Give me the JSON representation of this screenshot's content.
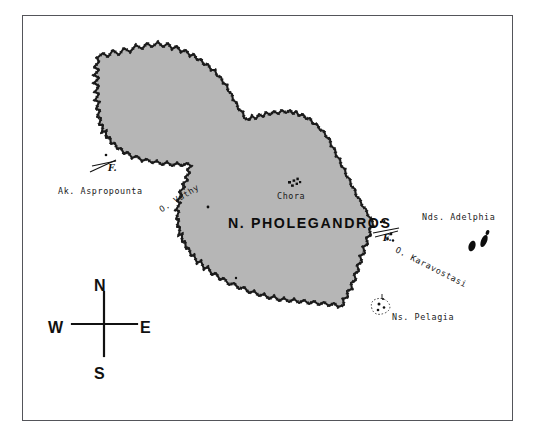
{
  "map": {
    "title": "N. PHOLEGANDROS",
    "style": {
      "land_fill": "#b6b6b6",
      "coast_stroke": "#1b1b1b",
      "frame_stroke": "#54555a",
      "sea_fill": "#ffffff",
      "text_color": "#1a1a1a"
    },
    "island_label": "N. PHOLEGANDROS",
    "settlements": [
      {
        "name": "Chora",
        "marker": "settlement-dots"
      }
    ],
    "capes": [
      {
        "name": "Ak. Aspropounta",
        "marker": "lighthouse",
        "marker_label": "F."
      }
    ],
    "bays": [
      {
        "name": "O. Vathy"
      },
      {
        "name": "O. Karavostasi",
        "marker": "lighthouse",
        "marker_label": "F."
      }
    ],
    "islets": [
      {
        "name": "Nds. Adelphia"
      },
      {
        "name": "Ns. Pelagia"
      }
    ],
    "lighthouse_marks": [
      {
        "id": "aspropounta",
        "label": "F."
      },
      {
        "id": "karavostasi",
        "label": "F."
      }
    ],
    "compass": {
      "north": "N",
      "south": "S",
      "east": "E",
      "west": "W"
    }
  }
}
